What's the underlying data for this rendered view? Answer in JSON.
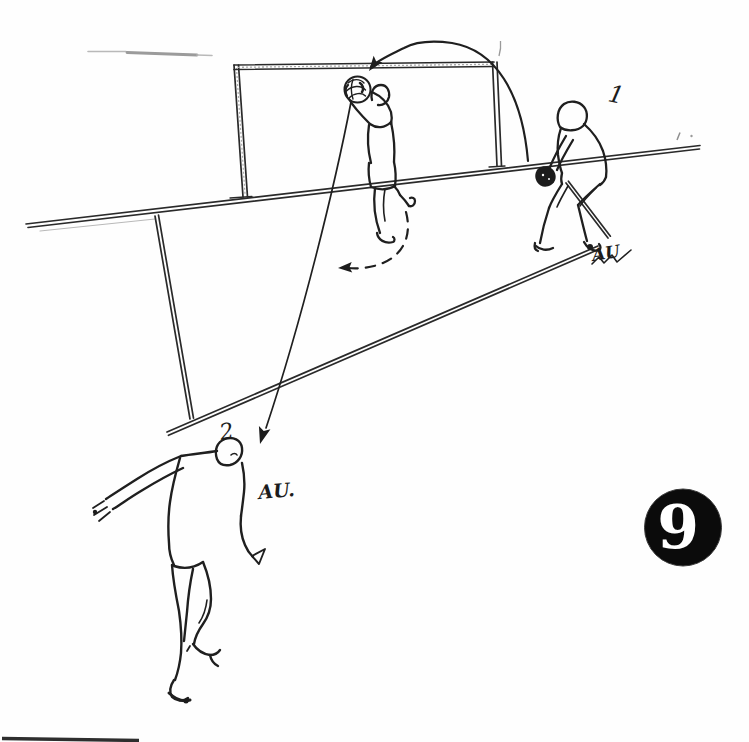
{
  "labels": {
    "thrower_number": "1",
    "receiver_number": "2",
    "thrower_note": "AU",
    "receiver_note": "AU.",
    "page_badge_number": "9"
  },
  "colors": {
    "ink": "#1f1f1f",
    "paper": "#fefefe",
    "badge_background": "#0b0b0b",
    "badge_text": "#ffffff"
  }
}
